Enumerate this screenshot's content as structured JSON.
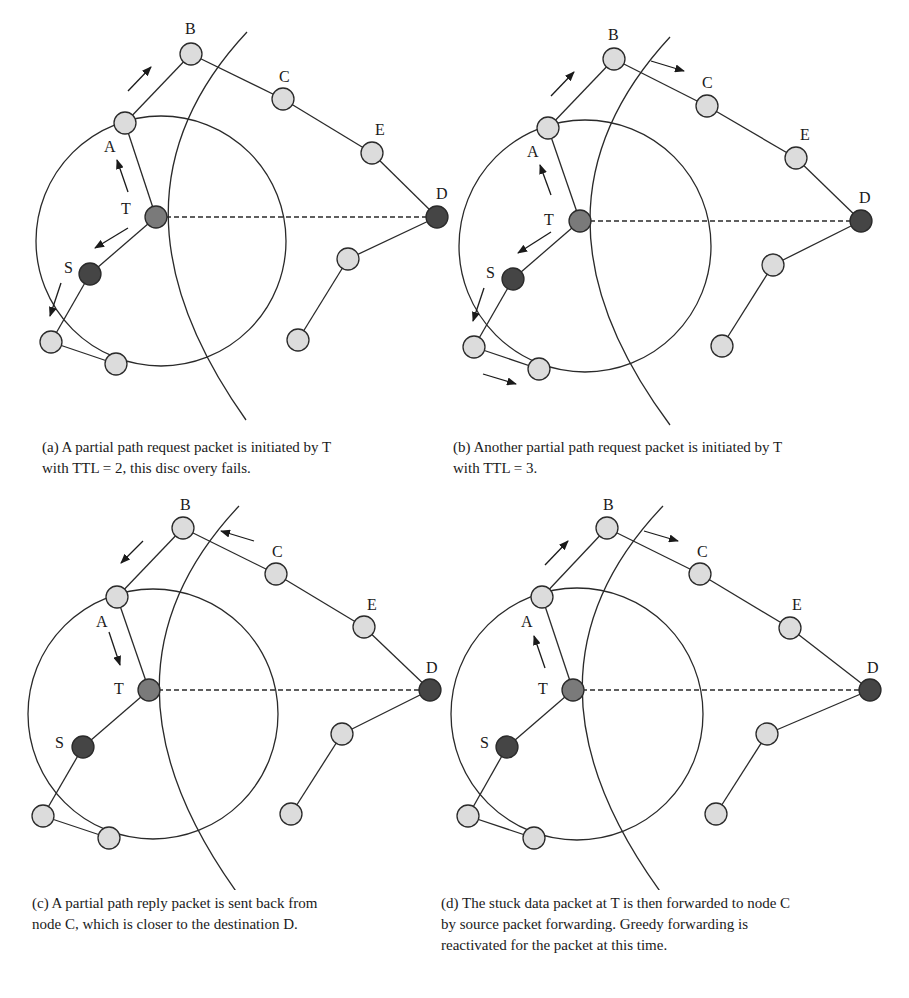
{
  "figure": {
    "panels": [
      {
        "id": "a",
        "caption_line1": "(a)  A partial path request packet is initiated by T",
        "caption_line2": "with TTL = 2, this disc overy fails.",
        "caption_line3": ""
      },
      {
        "id": "b",
        "caption_line1": "(b)  Another partial path request packet is initiated by T",
        "caption_line2": "with TTL = 3.",
        "caption_line3": ""
      },
      {
        "id": "c",
        "caption_line1": "(c)  A partial path reply packet is sent back from",
        "caption_line2": "node C, which is closer to the destination D.",
        "caption_line3": ""
      },
      {
        "id": "d",
        "caption_line1": "(d)  The stuck data packet at T is then forwarded to node C",
        "caption_line2": "by source packet forwarding. Greedy forwarding is",
        "caption_line3": "reactivated for the packet at this time."
      }
    ],
    "node_labels": {
      "A": "A",
      "B": "B",
      "C": "C",
      "D": "D",
      "E": "E",
      "S": "S",
      "T": "T"
    },
    "colors": {
      "node_light": "#dcdcdc",
      "node_T": "#7a7a7a",
      "node_dark": "#454545",
      "stroke": "#2a2a2a"
    }
  }
}
